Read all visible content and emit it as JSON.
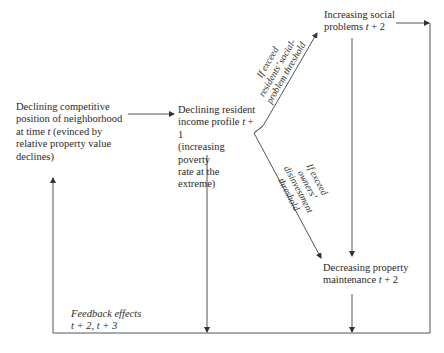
{
  "diagram": {
    "type": "flowchart",
    "nodes": {
      "competitive_position": {
        "lines": [
          "Declining competitive",
          "position of neighborhood",
          "at time ",
          "relative property value",
          "declines)"
        ],
        "line3_var": "t",
        "line3_rest": " (evinced by"
      },
      "income_profile": {
        "line1": "Declining resident",
        "line2_pre": "income profile ",
        "line2_var": "t",
        "line2_post": " + 1",
        "line3": "(increasing poverty",
        "line4": "rate at the extreme)"
      },
      "social_problems": {
        "line1": "Increasing social",
        "line2_pre": "problems ",
        "line2_var": "t",
        "line2_post": " + 2"
      },
      "property_maintenance": {
        "line1": "Decreasing property",
        "line2_pre": "maintenance ",
        "line2_var": "t",
        "line2_post": " + 2"
      }
    },
    "edge_labels": {
      "upper_branch": [
        "If exceed",
        "residents’ social-",
        "problem threshold"
      ],
      "lower_branch": [
        "If exceed",
        "owners’",
        "disinvestment",
        "threshold"
      ],
      "feedback": [
        "Feedback effects",
        "t + 2, t + 3"
      ]
    },
    "colors": {
      "line": "#555555",
      "text": "#2a2a2a",
      "background": "#ffffff"
    }
  }
}
